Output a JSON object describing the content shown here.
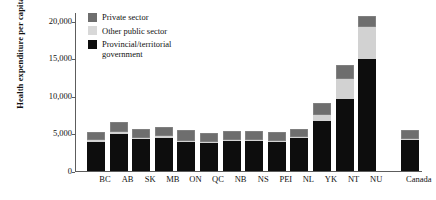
{
  "chart_data": {
    "type": "bar",
    "stacked": true,
    "title": "",
    "xlabel": "",
    "ylabel": "Health expenditure per capita",
    "ylim": [
      0,
      21000
    ],
    "yticks": [
      0,
      5000,
      10000,
      15000,
      20000
    ],
    "ytick_labels": [
      "0",
      "5,000",
      "10,000",
      "15,000",
      "20,000"
    ],
    "grid": false,
    "legend_position": "top-left",
    "categories": [
      "BC",
      "AB",
      "SK",
      "MB",
      "ON",
      "QC",
      "NB",
      "NS",
      "PEI",
      "NL",
      "YK",
      "NT",
      "NU",
      "Canada"
    ],
    "series": [
      {
        "name": "Provincial/territorial government",
        "color": "#0d0d0d",
        "values": [
          3850,
          4860,
          4290,
          4430,
          3860,
          3710,
          4000,
          4000,
          3860,
          4430,
          6710,
          9570,
          14860,
          4140
        ]
      },
      {
        "name": "Other public sector",
        "color": "#d2d2d2",
        "values": [
          290,
          290,
          140,
          290,
          140,
          140,
          140,
          140,
          140,
          140,
          710,
          2710,
          4290,
          140
        ]
      },
      {
        "name": "Private sector",
        "color": "#6e6e6e",
        "values": [
          1000,
          1430,
          1140,
          1140,
          1430,
          1140,
          1140,
          1140,
          1140,
          1000,
          1570,
          1860,
          1430,
          1140
        ]
      }
    ],
    "totals": [
      5140,
      6580,
      5570,
      5860,
      5430,
      4990,
      5280,
      5280,
      5140,
      5570,
      8990,
      14140,
      20580,
      5420
    ]
  },
  "legend": {
    "items": [
      {
        "label": "Private sector",
        "icon": "legend-swatch-private",
        "color": "#6e6e6e"
      },
      {
        "label": "Other public sector",
        "icon": "legend-swatch-other-public",
        "color": "#d8d8d8"
      },
      {
        "label": "Provincial/territorial government",
        "icon": "legend-swatch-government",
        "color": "#0d0d0d"
      }
    ]
  }
}
